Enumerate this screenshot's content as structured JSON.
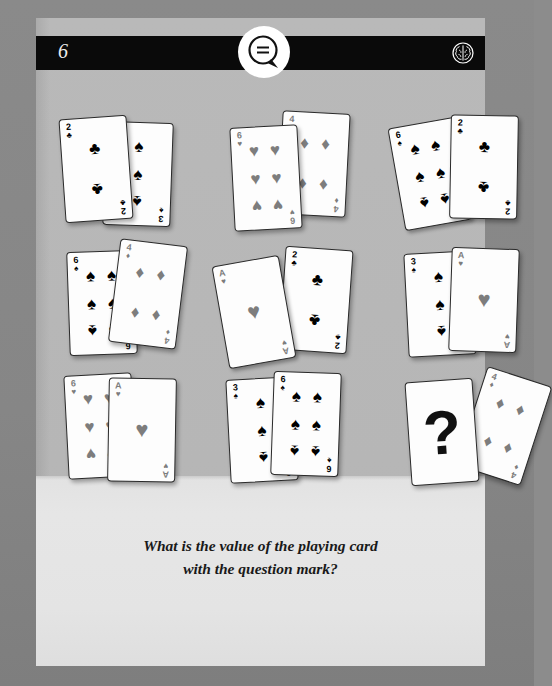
{
  "header": {
    "page_number": "6",
    "bubble_icon": "speech-bubble-icon",
    "brain_icon": "brain-icon"
  },
  "question": {
    "line1": "What is the value of the playing card",
    "line2": "with the question mark?"
  },
  "colors": {
    "page_bg": "#b9b9b9",
    "page_lower_bg": "#e4e4e4",
    "frame_bg": "#8a8a8a",
    "header_bg": "#0a0a0a",
    "black_suit": "#000000",
    "red_suit": "#7d7d7d"
  },
  "puzzle": {
    "type": "playing-card-logic-puzzle",
    "rows": 3,
    "columns": 3,
    "groups": [
      {
        "id": "g1",
        "position": {
          "row": 1,
          "col": 1
        },
        "cards": [
          {
            "rank": "3",
            "suit": "spades",
            "suit_symbol": "♠",
            "color": "black",
            "count": 3,
            "layer": "back",
            "rotation": 2
          },
          {
            "rank": "2",
            "suit": "clubs",
            "suit_symbol": "♣",
            "color": "black",
            "count": 2,
            "layer": "front",
            "rotation": -4
          }
        ]
      },
      {
        "id": "g2",
        "position": {
          "row": 1,
          "col": 2
        },
        "cards": [
          {
            "rank": "4",
            "suit": "diamonds",
            "suit_symbol": "♦",
            "color": "red",
            "count": 4,
            "layer": "back",
            "rotation": 3
          },
          {
            "rank": "6",
            "suit": "hearts",
            "suit_symbol": "♥",
            "color": "red",
            "count": 6,
            "layer": "front",
            "rotation": -3
          }
        ]
      },
      {
        "id": "g3",
        "position": {
          "row": 1,
          "col": 3
        },
        "cards": [
          {
            "rank": "6",
            "suit": "spades",
            "suit_symbol": "♠",
            "color": "black",
            "count": 6,
            "layer": "back",
            "rotation": -10
          },
          {
            "rank": "2",
            "suit": "clubs",
            "suit_symbol": "♣",
            "color": "black",
            "count": 2,
            "layer": "front",
            "rotation": 1
          }
        ]
      },
      {
        "id": "g4",
        "position": {
          "row": 2,
          "col": 1
        },
        "cards": [
          {
            "rank": "6",
            "suit": "spades",
            "suit_symbol": "♠",
            "color": "black",
            "count": 6,
            "layer": "back",
            "rotation": -2
          },
          {
            "rank": "4",
            "suit": "diamonds",
            "suit_symbol": "♦",
            "color": "red",
            "count": 4,
            "layer": "front",
            "rotation": 7
          }
        ]
      },
      {
        "id": "g5",
        "position": {
          "row": 2,
          "col": 2
        },
        "cards": [
          {
            "rank": "2",
            "suit": "clubs",
            "suit_symbol": "♣",
            "color": "black",
            "count": 2,
            "layer": "back",
            "rotation": 4
          },
          {
            "rank": "A",
            "suit": "hearts",
            "suit_symbol": "♥",
            "color": "red",
            "count": 1,
            "layer": "front",
            "rotation": -10
          }
        ]
      },
      {
        "id": "g6",
        "position": {
          "row": 2,
          "col": 3
        },
        "cards": [
          {
            "rank": "3",
            "suit": "spades",
            "suit_symbol": "♠",
            "color": "black",
            "count": 3,
            "layer": "back",
            "rotation": -3
          },
          {
            "rank": "A",
            "suit": "hearts",
            "suit_symbol": "♥",
            "color": "red",
            "count": 1,
            "layer": "front",
            "rotation": 2
          }
        ]
      },
      {
        "id": "g7",
        "position": {
          "row": 3,
          "col": 1
        },
        "cards": [
          {
            "rank": "6",
            "suit": "hearts",
            "suit_symbol": "♥",
            "color": "red",
            "count": 6,
            "layer": "back",
            "rotation": -3
          },
          {
            "rank": "A",
            "suit": "hearts",
            "suit_symbol": "♥",
            "color": "red",
            "count": 1,
            "layer": "front",
            "rotation": 1
          }
        ]
      },
      {
        "id": "g8",
        "position": {
          "row": 3,
          "col": 2
        },
        "cards": [
          {
            "rank": "3",
            "suit": "spades",
            "suit_symbol": "♠",
            "color": "black",
            "count": 3,
            "layer": "back",
            "rotation": -3
          },
          {
            "rank": "6",
            "suit": "spades",
            "suit_symbol": "♠",
            "color": "black",
            "count": 6,
            "layer": "front",
            "rotation": 2
          }
        ]
      },
      {
        "id": "g9",
        "position": {
          "row": 3,
          "col": 3
        },
        "cards": [
          {
            "rank": "4",
            "suit": "diamonds",
            "suit_symbol": "♦",
            "color": "red",
            "count": 4,
            "layer": "back",
            "rotation": 18
          },
          {
            "rank": "?",
            "suit": "unknown",
            "suit_symbol": "?",
            "color": "black",
            "count": 0,
            "layer": "front",
            "rotation": -4,
            "is_question": true
          }
        ]
      }
    ],
    "question_mark_glyph": "?"
  }
}
